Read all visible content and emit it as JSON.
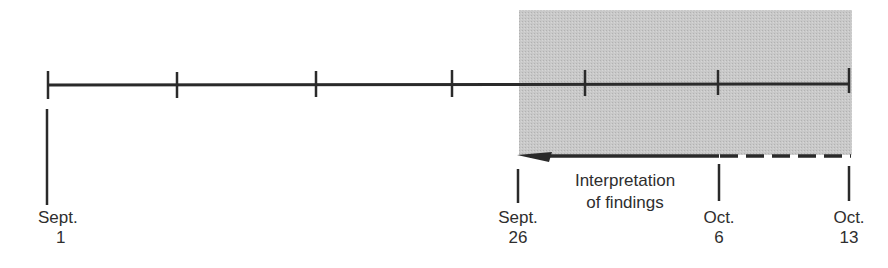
{
  "diagram": {
    "type": "timeline",
    "colors": {
      "line": "#2a2a2a",
      "shade": "#c4c4c4"
    },
    "main_axis": {
      "ticks_x": [
        48,
        177,
        316,
        452,
        585,
        718,
        849
      ]
    },
    "shaded_region": {
      "description": "Gray highlighted period from Sept. 26 to Oct. 13"
    },
    "arrow": {
      "label_line1": "Interpretation",
      "label_line2": "of findings",
      "solid_from": "Sept. 26",
      "solid_to": "Oct. 6",
      "dashed_from": "Oct. 6",
      "dashed_to": "Oct. 13"
    },
    "markers": [
      {
        "month": "Sept.",
        "day": "1"
      },
      {
        "month": "Sept.",
        "day": "26"
      },
      {
        "month": "Oct.",
        "day": "6"
      },
      {
        "month": "Oct.",
        "day": "13"
      }
    ]
  }
}
